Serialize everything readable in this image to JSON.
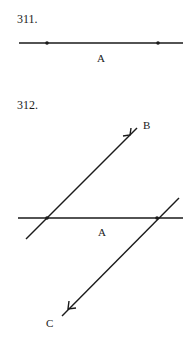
{
  "problems": [
    {
      "number": "311.",
      "line_label": "A"
    },
    {
      "number": "312.",
      "line_label": "A",
      "ray_b_label": "B",
      "ray_c_label": "C"
    }
  ],
  "colors": {
    "ink": "#1a1a1a",
    "background": "#ffffff"
  }
}
